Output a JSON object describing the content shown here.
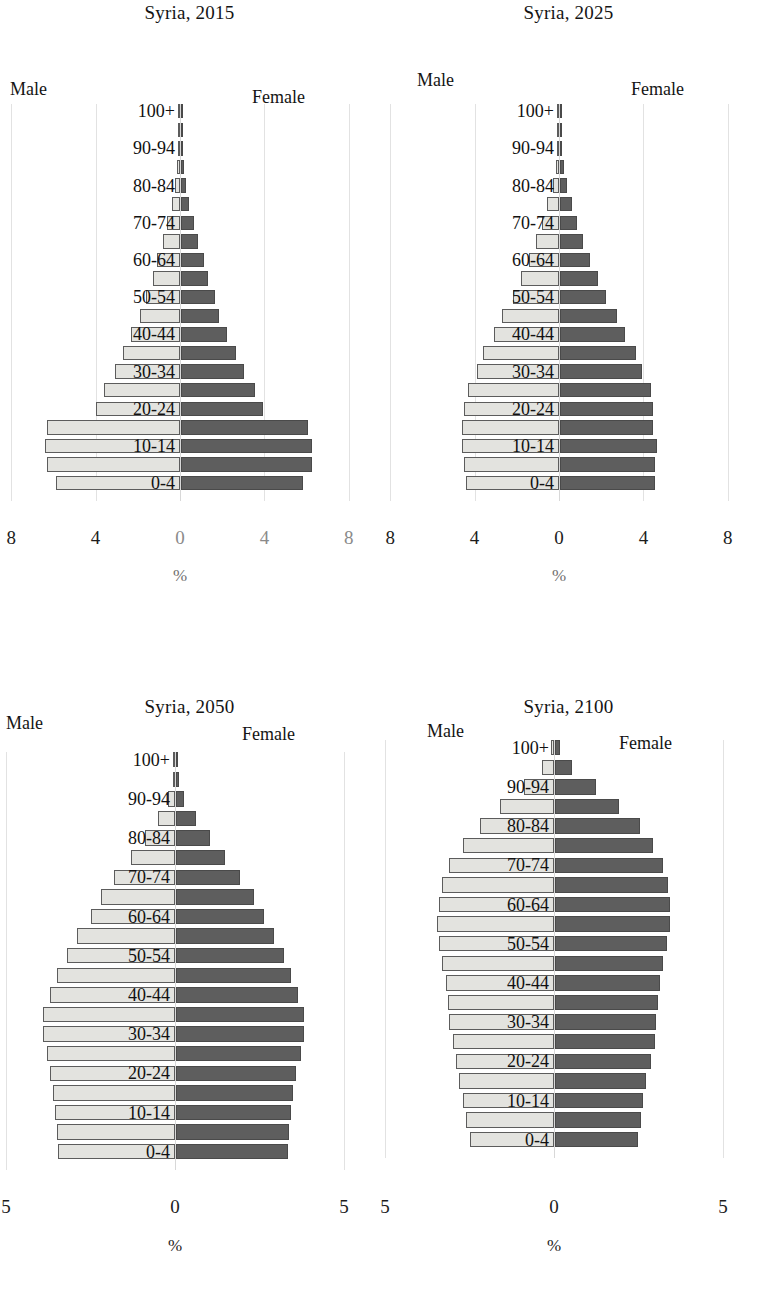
{
  "figure": {
    "subject": "Syria",
    "unit_label": "%",
    "male_label": "Male",
    "female_label": "Female",
    "male_color": "#e3e3df",
    "female_color": "#5e5e5e"
  },
  "age_groups": [
    "0-4",
    "5-9",
    "10-14",
    "15-19",
    "20-24",
    "25-29",
    "30-34",
    "35-39",
    "40-44",
    "45-49",
    "50-54",
    "55-59",
    "60-64",
    "65-69",
    "70-74",
    "75-79",
    "80-84",
    "85-89",
    "90-94",
    "95-99",
    "100+"
  ],
  "visible_age_labels": [
    "0-4",
    "10-14",
    "20-24",
    "30-34",
    "40-44",
    "50-54",
    "60-64",
    "70-74",
    "80-84",
    "90-94",
    "100+"
  ],
  "chart_data": [
    {
      "type": "bar",
      "title": "Syria, 2015",
      "xlabel": "%",
      "ylabel": "",
      "orientation": "population-pyramid",
      "xlim": [
        -8,
        8
      ],
      "ticks": [
        8,
        4,
        0,
        4,
        8
      ],
      "grid": true,
      "legend_position": "top-outside",
      "categories": [
        "0-4",
        "5-9",
        "10-14",
        "15-19",
        "20-24",
        "25-29",
        "30-34",
        "35-39",
        "40-44",
        "45-49",
        "50-54",
        "55-59",
        "60-64",
        "65-69",
        "70-74",
        "75-79",
        "80-84",
        "85-89",
        "90-94",
        "95-99",
        "100+"
      ],
      "series": [
        {
          "name": "Male",
          "values": [
            5.9,
            6.3,
            6.4,
            6.3,
            4.0,
            3.6,
            3.1,
            2.7,
            2.3,
            1.9,
            1.6,
            1.3,
            1.1,
            0.8,
            0.6,
            0.4,
            0.25,
            0.12,
            0.05,
            0.015,
            0.004
          ]
        },
        {
          "name": "Female",
          "values": [
            5.8,
            6.2,
            6.2,
            6.0,
            3.9,
            3.5,
            3.0,
            2.6,
            2.2,
            1.8,
            1.6,
            1.3,
            1.1,
            0.8,
            0.6,
            0.4,
            0.25,
            0.13,
            0.05,
            0.015,
            0.004
          ]
        }
      ]
    },
    {
      "type": "bar",
      "title": "Syria, 2025",
      "xlabel": "%",
      "ylabel": "",
      "orientation": "population-pyramid",
      "xlim": [
        -8,
        8
      ],
      "ticks": [
        8,
        4,
        0,
        4,
        8
      ],
      "grid": true,
      "legend_position": "top-outside",
      "categories": [
        "0-4",
        "5-9",
        "10-14",
        "15-19",
        "20-24",
        "25-29",
        "30-34",
        "35-39",
        "40-44",
        "45-49",
        "50-54",
        "55-59",
        "60-64",
        "65-69",
        "70-74",
        "75-79",
        "80-84",
        "85-89",
        "90-94",
        "95-99",
        "100+"
      ],
      "series": [
        {
          "name": "Male",
          "values": [
            4.4,
            4.5,
            4.6,
            4.6,
            4.5,
            4.3,
            3.9,
            3.6,
            3.1,
            2.7,
            2.2,
            1.8,
            1.4,
            1.1,
            0.8,
            0.55,
            0.3,
            0.16,
            0.06,
            0.02,
            0.005
          ]
        },
        {
          "name": "Female",
          "values": [
            4.5,
            4.5,
            4.6,
            4.4,
            4.4,
            4.3,
            3.9,
            3.6,
            3.1,
            2.7,
            2.2,
            1.8,
            1.4,
            1.1,
            0.8,
            0.55,
            0.32,
            0.17,
            0.06,
            0.02,
            0.005
          ]
        }
      ]
    },
    {
      "type": "bar",
      "title": "Syria, 2050",
      "xlabel": "%",
      "ylabel": "",
      "orientation": "population-pyramid",
      "xlim": [
        -5,
        5
      ],
      "ticks": [
        5,
        0,
        5
      ],
      "grid": true,
      "legend_position": "top-outside",
      "categories": [
        "0-4",
        "5-9",
        "10-14",
        "15-19",
        "20-24",
        "25-29",
        "30-34",
        "35-39",
        "40-44",
        "45-49",
        "50-54",
        "55-59",
        "60-64",
        "65-69",
        "70-74",
        "75-79",
        "80-84",
        "85-89",
        "90-94",
        "95-99",
        "100+"
      ],
      "series": [
        {
          "name": "Male",
          "values": [
            3.45,
            3.5,
            3.55,
            3.6,
            3.7,
            3.8,
            3.9,
            3.9,
            3.7,
            3.5,
            3.2,
            2.9,
            2.5,
            2.2,
            1.8,
            1.3,
            0.9,
            0.5,
            0.2,
            0.06,
            0.01
          ]
        },
        {
          "name": "Female",
          "values": [
            3.3,
            3.35,
            3.4,
            3.45,
            3.55,
            3.7,
            3.8,
            3.8,
            3.6,
            3.4,
            3.2,
            2.9,
            2.6,
            2.3,
            1.9,
            1.45,
            1.0,
            0.6,
            0.25,
            0.08,
            0.02
          ]
        }
      ]
    },
    {
      "type": "bar",
      "title": "Syria, 2100",
      "xlabel": "%",
      "ylabel": "",
      "orientation": "population-pyramid",
      "xlim": [
        -5,
        5
      ],
      "ticks": [
        5,
        0,
        5
      ],
      "grid": true,
      "legend_position": "top-outside",
      "categories": [
        "0-4",
        "5-9",
        "10-14",
        "15-19",
        "20-24",
        "25-29",
        "30-34",
        "35-39",
        "40-44",
        "45-49",
        "50-54",
        "55-59",
        "60-64",
        "65-69",
        "70-74",
        "75-79",
        "80-84",
        "85-89",
        "90-94",
        "95-99",
        "100+"
      ],
      "series": [
        {
          "name": "Male",
          "values": [
            2.5,
            2.6,
            2.7,
            2.8,
            2.9,
            3.0,
            3.1,
            3.15,
            3.2,
            3.3,
            3.4,
            3.45,
            3.4,
            3.3,
            3.1,
            2.7,
            2.2,
            1.6,
            0.9,
            0.35,
            0.08
          ]
        },
        {
          "name": "Female",
          "values": [
            2.45,
            2.55,
            2.6,
            2.7,
            2.85,
            2.95,
            3.0,
            3.05,
            3.1,
            3.2,
            3.3,
            3.4,
            3.4,
            3.35,
            3.2,
            2.9,
            2.5,
            1.9,
            1.2,
            0.5,
            0.15
          ]
        }
      ]
    }
  ],
  "panels": [
    {
      "id": "syria-2015",
      "title": "Syria, 2015",
      "male_label": "Male",
      "female_label": "Female",
      "unit": "%",
      "ticks": [
        "8",
        "4",
        "0",
        "4",
        "8"
      ]
    },
    {
      "id": "syria-2025",
      "title": "Syria, 2025",
      "male_label": "Male",
      "female_label": "Female",
      "unit": "%",
      "ticks": [
        "8",
        "4",
        "0",
        "4",
        "8"
      ]
    },
    {
      "id": "syria-2050",
      "title": "Syria, 2050",
      "male_label": "Male",
      "female_label": "Female",
      "unit": "%",
      "ticks": [
        "5",
        "0",
        "5"
      ]
    },
    {
      "id": "syria-2100",
      "title": "Syria, 2100",
      "male_label": "Male",
      "female_label": "Female",
      "unit": "%",
      "ticks": [
        "5",
        "0",
        "5"
      ]
    }
  ]
}
